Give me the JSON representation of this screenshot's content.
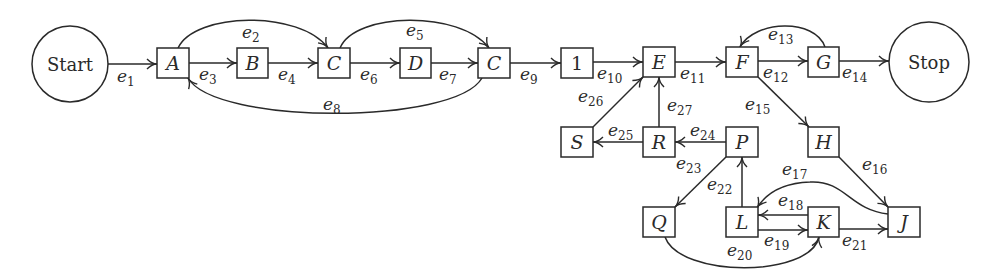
{
  "diagram": {
    "type": "directed-graph",
    "terminals": [
      {
        "id": "start",
        "label": "Start",
        "cx": 70,
        "cy": 64,
        "r": 38
      },
      {
        "id": "stop",
        "label": "Stop",
        "cx": 929,
        "cy": 62,
        "r": 40
      }
    ],
    "nodes": [
      {
        "id": "A",
        "label": "A",
        "x": 157,
        "y": 48
      },
      {
        "id": "B",
        "label": "B",
        "x": 237,
        "y": 48
      },
      {
        "id": "C1",
        "label": "C",
        "x": 318,
        "y": 48
      },
      {
        "id": "D",
        "label": "D",
        "x": 400,
        "y": 48
      },
      {
        "id": "C2",
        "label": "C",
        "x": 478,
        "y": 48
      },
      {
        "id": "N1",
        "label": "1",
        "x": 561,
        "y": 48
      },
      {
        "id": "E",
        "label": "E",
        "x": 643,
        "y": 47
      },
      {
        "id": "F",
        "label": "F",
        "x": 726,
        "y": 47
      },
      {
        "id": "G",
        "label": "G",
        "x": 808,
        "y": 47
      },
      {
        "id": "S",
        "label": "S",
        "x": 561,
        "y": 127
      },
      {
        "id": "R",
        "label": "R",
        "x": 643,
        "y": 127
      },
      {
        "id": "P",
        "label": "P",
        "x": 726,
        "y": 127
      },
      {
        "id": "H",
        "label": "H",
        "x": 808,
        "y": 127
      },
      {
        "id": "Q",
        "label": "Q",
        "x": 643,
        "y": 207
      },
      {
        "id": "L",
        "label": "L",
        "x": 726,
        "y": 207
      },
      {
        "id": "K",
        "label": "K",
        "x": 808,
        "y": 207
      },
      {
        "id": "J",
        "label": "J",
        "x": 888,
        "y": 207
      }
    ],
    "edges": [
      {
        "id": "e1",
        "base": "e",
        "sub": "1",
        "from": "Start",
        "to": "A"
      },
      {
        "id": "e2",
        "base": "e",
        "sub": "2",
        "from": "A",
        "to": "C"
      },
      {
        "id": "e3",
        "base": "e",
        "sub": "3",
        "from": "A",
        "to": "B"
      },
      {
        "id": "e4",
        "base": "e",
        "sub": "4",
        "from": "B",
        "to": "C"
      },
      {
        "id": "e5",
        "base": "e",
        "sub": "5",
        "from": "C",
        "to": "C"
      },
      {
        "id": "e6",
        "base": "e",
        "sub": "6",
        "from": "C",
        "to": "D"
      },
      {
        "id": "e7",
        "base": "e",
        "sub": "7",
        "from": "D",
        "to": "C"
      },
      {
        "id": "e8",
        "base": "e",
        "sub": "8",
        "from": "C",
        "to": "A"
      },
      {
        "id": "e9",
        "base": "e",
        "sub": "9",
        "from": "C",
        "to": "1"
      },
      {
        "id": "e10",
        "base": "e",
        "sub": "10",
        "from": "1",
        "to": "E"
      },
      {
        "id": "e11",
        "base": "e",
        "sub": "11",
        "from": "E",
        "to": "F"
      },
      {
        "id": "e12",
        "base": "e",
        "sub": "12",
        "from": "F",
        "to": "G"
      },
      {
        "id": "e13",
        "base": "e",
        "sub": "13",
        "from": "G",
        "to": "F"
      },
      {
        "id": "e14",
        "base": "e",
        "sub": "14",
        "from": "G",
        "to": "Stop"
      },
      {
        "id": "e15",
        "base": "e",
        "sub": "15",
        "from": "F",
        "to": "H"
      },
      {
        "id": "e16",
        "base": "e",
        "sub": "16",
        "from": "H",
        "to": "J"
      },
      {
        "id": "e17",
        "base": "e",
        "sub": "17",
        "from": "J",
        "to": "L"
      },
      {
        "id": "e18",
        "base": "e",
        "sub": "18",
        "from": "K",
        "to": "L"
      },
      {
        "id": "e19",
        "base": "e",
        "sub": "19",
        "from": "L",
        "to": "K"
      },
      {
        "id": "e20",
        "base": "e",
        "sub": "20",
        "from": "Q",
        "to": "K"
      },
      {
        "id": "e21",
        "base": "e",
        "sub": "21",
        "from": "K",
        "to": "J"
      },
      {
        "id": "e22",
        "base": "e",
        "sub": "22",
        "from": "L",
        "to": "P"
      },
      {
        "id": "e23",
        "base": "e",
        "sub": "23",
        "from": "P",
        "to": "Q"
      },
      {
        "id": "e24",
        "base": "e",
        "sub": "24",
        "from": "P",
        "to": "R"
      },
      {
        "id": "e25",
        "base": "e",
        "sub": "25",
        "from": "R",
        "to": "S"
      },
      {
        "id": "e26",
        "base": "e",
        "sub": "26",
        "from": "S",
        "to": "E"
      },
      {
        "id": "e27",
        "base": "e",
        "sub": "27",
        "from": "R",
        "to": "E"
      }
    ]
  }
}
